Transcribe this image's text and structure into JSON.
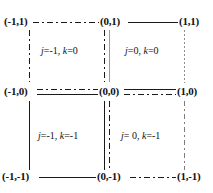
{
  "figure": {
    "background_color": "#ffffff",
    "line_color_dark": "#1a1a1a",
    "line_color_gray": "#8f8f8f",
    "text_color": "#111111"
  },
  "vertices": {
    "top_left": "(-1,1)",
    "top_mid": "(0,1)",
    "top_right": "(1,1)",
    "mid_left": "(-1,0)",
    "center": "(0,0)",
    "mid_right": "(1,0)",
    "bottom_left": "(-1,-1)",
    "bottom_mid": "(0,-1)",
    "bottom_right": "(1,-1)"
  },
  "cells": {
    "top_left": "j=-1, k=0",
    "top_right": "j=0, k=0",
    "bottom_left": "j=-1, k=-1",
    "bottom_right": "j= 0, k=-1"
  },
  "edges": {
    "top_left_horizontal": "dash-dot",
    "top_right_horizontal": "solid",
    "mid_left_horizontal_upper": "dash-dot",
    "mid_left_horizontal_lower": "solid",
    "mid_right_horizontal_upper": "solid",
    "mid_right_horizontal_lower": "dash-dot",
    "bottom_left_horizontal": "solid",
    "bottom_right_horizontal": "dash-dot",
    "left_vertical_upper": "dash-dot",
    "left_vertical_lower": "solid",
    "center_vertical_upper_left": "dash-dot",
    "center_vertical_upper_right": "solid-gray",
    "center_vertical_lower_left": "solid",
    "center_vertical_lower_right": "dash-dot",
    "right_vertical_upper": "dotted",
    "right_vertical_lower": "dash-dot"
  },
  "chart_data": {
    "type": "diagram",
    "x": [
      -1,
      0,
      1
    ],
    "y": [
      -1,
      0,
      1
    ],
    "xlim": [
      -1,
      1
    ],
    "ylim": [
      -1,
      1
    ],
    "grid": true,
    "xlabel": "",
    "ylabel": "",
    "nodes": [
      {
        "label": "(-1,1)",
        "x": -1,
        "y": 1
      },
      {
        "label": "(0,1)",
        "x": 0,
        "y": 1
      },
      {
        "label": "(1,1)",
        "x": 1,
        "y": 1
      },
      {
        "label": "(-1,0)",
        "x": -1,
        "y": 0
      },
      {
        "label": "(0,0)",
        "x": 0,
        "y": 0
      },
      {
        "label": "(1,0)",
        "x": 1,
        "y": 0
      },
      {
        "label": "(-1,-1)",
        "x": -1,
        "y": -1
      },
      {
        "label": "(0,-1)",
        "x": 0,
        "y": -1
      },
      {
        "label": "(1,-1)",
        "x": 1,
        "y": -1
      }
    ],
    "regions": [
      {
        "label": "j=-1, k=0",
        "j": -1,
        "k": 0,
        "x_range": [
          -1,
          0
        ],
        "y_range": [
          0,
          1
        ]
      },
      {
        "label": "j=0, k=0",
        "j": 0,
        "k": 0,
        "x_range": [
          0,
          1
        ],
        "y_range": [
          0,
          1
        ]
      },
      {
        "label": "j=-1, k=-1",
        "j": -1,
        "k": -1,
        "x_range": [
          -1,
          0
        ],
        "y_range": [
          -1,
          0
        ]
      },
      {
        "label": "j= 0, k=-1",
        "j": 0,
        "k": -1,
        "x_range": [
          0,
          1
        ],
        "y_range": [
          -1,
          0
        ]
      }
    ]
  }
}
